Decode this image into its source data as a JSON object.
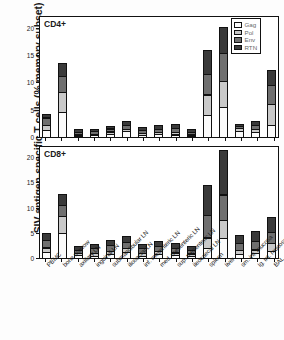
{
  "chart_data": {
    "type": "bar",
    "subtype": "stacked-bar",
    "title": "",
    "ylabel": "SIV antigen-specific T cells (% memory subset)",
    "xlabel": "",
    "ylim": [
      0,
      22
    ],
    "yticks": [
      0,
      5,
      10,
      15,
      20
    ],
    "grid": false,
    "legend_position": "top-right",
    "legend": [
      "Gag",
      "Pol",
      "Env",
      "RTN"
    ],
    "colors": {
      "Gag": "#fbfbfb",
      "Pol": "#c9c9c9",
      "Env": "#6f6f6f",
      "RTN": "#3a3a3a",
      "outline": "#111111"
    },
    "categories": [
      "PBMC",
      "bone marrow",
      "axillary LN",
      "inguinal LN",
      "submandibular LN",
      "iliosacral LN",
      "inf. mesenteric LN",
      "med. mesenteric LN",
      "sup. mesenteric LN",
      "ileocaecal LN",
      "spleen",
      "liver",
      "sm. int. mucosa",
      "lg. int. mucosa",
      "BAL"
    ],
    "panels": [
      {
        "label": "CD4+",
        "series": [
          {
            "name": "Gag",
            "values": [
              1.4,
              4.7,
              0.4,
              0.5,
              0.7,
              1.2,
              0.5,
              0.7,
              0.6,
              0.4,
              4.2,
              5.6,
              1.2,
              1.0,
              2.3
            ]
          },
          {
            "name": "Pol",
            "values": [
              1.1,
              3.8,
              0.4,
              0.4,
              0.6,
              0.6,
              0.5,
              0.5,
              0.6,
              0.4,
              3.9,
              5.0,
              0.7,
              0.7,
              4.0
            ]
          },
          {
            "name": "Env",
            "values": [
              1.5,
              3.1,
              0.6,
              0.6,
              0.7,
              0.8,
              0.7,
              0.7,
              0.9,
              0.6,
              4.0,
              5.3,
              0.5,
              0.9,
              3.7
            ]
          },
          {
            "name": "RTN",
            "values": [
              0.9,
              2.6,
              0.6,
              0.6,
              0.7,
              0.9,
              0.8,
              0.9,
              0.9,
              0.6,
              4.6,
              4.9,
              0.6,
              1.0,
              2.9
            ]
          }
        ],
        "totals": [
          4.9,
          14.2,
          2.0,
          2.1,
          2.7,
          3.5,
          2.5,
          2.8,
          3.0,
          2.0,
          16.7,
          20.8,
          3.0,
          3.6,
          12.9
        ]
      },
      {
        "label": "CD8+",
        "series": [
          {
            "name": "Gag",
            "values": [
              1.3,
              5.1,
              0.7,
              0.6,
              0.9,
              1.3,
              0.6,
              0.9,
              0.7,
              0.6,
              2.2,
              4.2,
              1.0,
              1.1,
              1.6
            ]
          },
          {
            "name": "Pol",
            "values": [
              1.1,
              3.6,
              0.6,
              0.7,
              0.8,
              1.0,
              0.7,
              0.8,
              0.7,
              0.6,
              2.2,
              3.6,
              0.9,
              0.9,
              1.7
            ]
          },
          {
            "name": "Env",
            "values": [
              1.7,
              2.4,
              0.8,
              1.1,
              1.3,
              1.3,
              1.1,
              1.2,
              1.1,
              0.9,
              4.6,
              5.3,
              1.6,
              1.8,
              2.4
            ]
          },
          {
            "name": "RTN",
            "values": [
              1.6,
              2.2,
              0.9,
              1.1,
              1.2,
              1.4,
              1.1,
              1.2,
              1.2,
              1.0,
              6.2,
              9.0,
              1.8,
              2.3,
              3.2
            ]
          }
        ],
        "totals": [
          5.7,
          13.3,
          3.0,
          3.5,
          4.2,
          5.0,
          3.5,
          4.1,
          3.7,
          3.1,
          15.2,
          22.1,
          5.3,
          6.1,
          8.9
        ]
      }
    ]
  }
}
